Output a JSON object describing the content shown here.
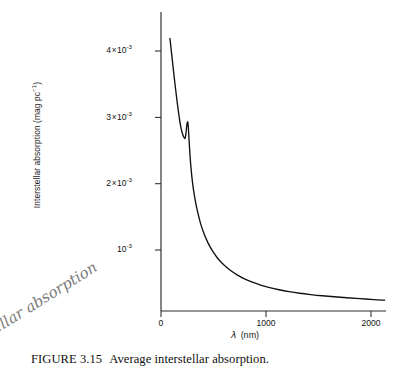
{
  "figure": {
    "caption_number": "FIGURE 3.15",
    "caption_text": "Average interstellar absorption.",
    "handwritten_note": "tellar absorption"
  },
  "chart_data": {
    "type": "line",
    "title": "Average interstellar absorption.",
    "xlabel_symbol": "λ",
    "xlabel_unit": "(nm)",
    "ylabel": "Interstellar absorption (mag pc⁻¹)",
    "xlim": [
      0,
      2130
    ],
    "ylim": [
      0,
      4.58
    ],
    "y_scale_note": "values in units of 1e-3 mag pc^-1",
    "grid": false,
    "legend": false,
    "xticks": [
      0,
      1000,
      2000
    ],
    "xtick_labels": [
      "0",
      "1000",
      "2000"
    ],
    "yticks": [
      1,
      2,
      3,
      4
    ],
    "ytick_labels": [
      "10⁻³",
      "2 × 10⁻³",
      "3 × 10⁻³",
      "4 × 10⁻³"
    ],
    "ytick_labels_parts": [
      {
        "coef": "",
        "mult": "",
        "base": "10",
        "exp": "-3"
      },
      {
        "coef": "2",
        "mult": "×",
        "base": "10",
        "exp": "-3"
      },
      {
        "coef": "3",
        "mult": "×",
        "base": "10",
        "exp": "-3"
      },
      {
        "coef": "4",
        "mult": "×",
        "base": "10",
        "exp": "-3"
      }
    ],
    "series": [
      {
        "name": "Average interstellar absorption",
        "color": "#111111",
        "x": [
          85,
          95,
          108,
          122,
          138,
          155,
          172,
          188,
          200,
          210,
          218,
          225,
          231,
          238,
          244,
          250,
          255,
          259,
          263,
          268,
          275,
          285,
          300,
          320,
          345,
          375,
          410,
          450,
          495,
          545,
          600,
          660,
          725,
          795,
          870,
          950,
          1035,
          1125,
          1220,
          1320,
          1425,
          1535,
          1650,
          1770,
          1895,
          2025,
          2130
        ],
        "y": [
          4.19,
          4.05,
          3.86,
          3.66,
          3.44,
          3.22,
          3.02,
          2.86,
          2.78,
          2.73,
          2.7,
          2.685,
          2.69,
          2.76,
          2.86,
          2.92,
          2.93,
          2.88,
          2.78,
          2.64,
          2.46,
          2.25,
          2.02,
          1.8,
          1.6,
          1.41,
          1.245,
          1.1,
          0.975,
          0.865,
          0.775,
          0.695,
          0.625,
          0.565,
          0.515,
          0.47,
          0.432,
          0.4,
          0.372,
          0.348,
          0.328,
          0.31,
          0.295,
          0.28,
          0.266,
          0.252,
          0.243
        ]
      }
    ],
    "annotations": [
      {
        "name": "uv-bump",
        "x": 255,
        "y": 2.93,
        "note": "secondary absorption bump"
      },
      {
        "name": "local-minimum",
        "x": 231,
        "y": 2.685,
        "note": "dip before bump"
      }
    ]
  },
  "axes": {
    "x_axis_label_full": "λ (nm)",
    "y_axis_label_full": "Interstellar absorption (mag pc⁻¹)"
  }
}
